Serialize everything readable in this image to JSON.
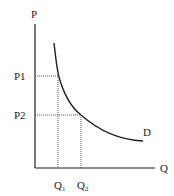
{
  "diagram": {
    "type": "demand-curve",
    "axes": {
      "y_label": "P",
      "x_label": "Q"
    },
    "price_levels": [
      {
        "label": "P1",
        "y": 76
      },
      {
        "label": "P2",
        "y": 115
      }
    ],
    "quantity_levels": [
      {
        "label": "Q",
        "sub": "1",
        "x": 58
      },
      {
        "label": "Q",
        "sub": "2",
        "x": 81
      }
    ],
    "curve_label": "D",
    "colors": {
      "axis": "#222222",
      "curve": "#222222",
      "guide": "#444444"
    }
  }
}
